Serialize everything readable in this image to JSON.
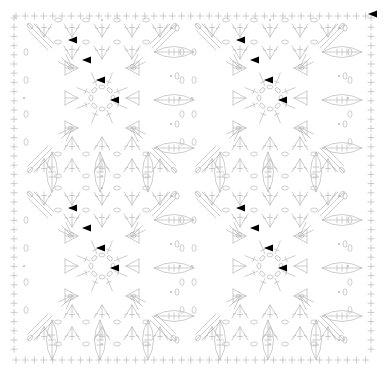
{
  "document": {
    "title": "Crochet Square Motif Chart",
    "kind": "crochet-stitch-diagram",
    "width": 385,
    "height": 377,
    "background_color": "#ffffff"
  },
  "style": {
    "stroke_color": "#b8b8b8",
    "stroke_color_dark": "#9a9a9a",
    "marker_color": "#000000",
    "stroke_width": 0.7,
    "symbol_font_size": 7
  },
  "layout": {
    "motif_columns": 2,
    "motif_rows": 2,
    "motif_size": 160,
    "motif_origins": [
      {
        "x": 22,
        "y": 18
      },
      {
        "x": 190,
        "y": 18
      },
      {
        "x": 22,
        "y": 186
      },
      {
        "x": 190,
        "y": 186
      }
    ],
    "border": {
      "top_y": 16,
      "bottom_y": 360,
      "left_x": 14,
      "right_x": 371,
      "symbol": "+",
      "symbol_name": "single-crochet",
      "spacing": 9.2,
      "count_horizontal": 39,
      "count_vertical": 37
    },
    "join_column_x": [
      174,
      342
    ],
    "join_row_y": [
      172,
      340
    ]
  },
  "legend": {
    "symbols": [
      {
        "name": "chain-stitch",
        "glyph": "oval",
        "label": "ch"
      },
      {
        "name": "slip-stitch",
        "glyph": "dot",
        "label": "sl st"
      },
      {
        "name": "single-crochet",
        "glyph": "plus",
        "label": "sc"
      },
      {
        "name": "double-crochet",
        "glyph": "t-bar",
        "label": "dc"
      },
      {
        "name": "treble-crochet",
        "glyph": "double-t-bar",
        "label": "tr"
      },
      {
        "name": "v-stitch-cluster",
        "glyph": "fan",
        "label": "V-st"
      },
      {
        "name": "decrease-cluster",
        "glyph": "inverted-fan",
        "label": "dec"
      },
      {
        "name": "round-start-marker",
        "glyph": "solid-arrow",
        "label": "start"
      }
    ]
  },
  "chart_data": {
    "type": "diagram",
    "title": "Crochet Square Motif Chart",
    "motif_count": 4,
    "rounds_per_motif": 6,
    "markers_per_motif": 4,
    "marker_offsets": [
      {
        "x": 46,
        "y": 22
      },
      {
        "x": 60,
        "y": 42
      },
      {
        "x": 74,
        "y": 62
      },
      {
        "x": 88,
        "y": 82
      }
    ],
    "center_ring": {
      "radius": 11,
      "chain_count": 8,
      "offset": {
        "x": 80,
        "y": 80
      }
    }
  }
}
